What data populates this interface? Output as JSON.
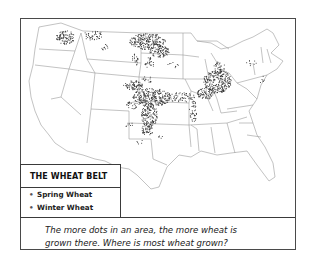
{
  "map": {
    "subject": "United States wheat production",
    "colors": {
      "dots": "#333333",
      "borders": "#9a9a9a",
      "frame": "#4a4a4a"
    }
  },
  "legend": {
    "title": "THE WHEAT BELT",
    "items": [
      {
        "bullet": "•",
        "label": "Spring Wheat"
      },
      {
        "bullet": "•",
        "label": "Winter Wheat"
      }
    ]
  },
  "caption": {
    "line1": "The more dots in an area, the more wheat is",
    "line2": "grown there. Where is most wheat grown?"
  },
  "regions": [
    {
      "name": "eastern-washington",
      "density": "high"
    },
    {
      "name": "northern-montana",
      "density": "medium"
    },
    {
      "name": "north-dakota",
      "density": "high"
    },
    {
      "name": "south-dakota",
      "density": "medium"
    },
    {
      "name": "western-minnesota",
      "density": "low"
    },
    {
      "name": "kansas",
      "density": "high"
    },
    {
      "name": "western-oklahoma",
      "density": "high"
    },
    {
      "name": "northern-texas",
      "density": "low"
    },
    {
      "name": "eastern-colorado",
      "density": "medium"
    },
    {
      "name": "nebraska",
      "density": "medium"
    },
    {
      "name": "missouri-illinois",
      "density": "medium"
    },
    {
      "name": "indiana-ohio",
      "density": "high"
    },
    {
      "name": "michigan",
      "density": "medium"
    },
    {
      "name": "new-york",
      "density": "low"
    },
    {
      "name": "pennsylvania",
      "density": "low"
    },
    {
      "name": "new-mexico",
      "density": "low"
    }
  ]
}
